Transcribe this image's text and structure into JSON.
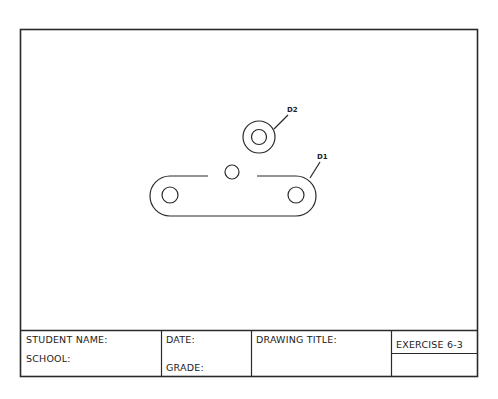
{
  "drawing": {
    "callouts": [
      {
        "id": "d1",
        "text": "D1"
      },
      {
        "id": "d2",
        "text": "D2"
      }
    ]
  },
  "title_block": {
    "student_name_label": "STUDENT NAME:",
    "school_label": "SCHOOL:",
    "date_label": "DATE:",
    "grade_label": "GRADE:",
    "drawing_title_label": "DRAWING TITLE:",
    "exercise_label": "EXERCISE 6-3"
  },
  "colors": {
    "line": "#2a2a2a",
    "background": "#ffffff"
  }
}
